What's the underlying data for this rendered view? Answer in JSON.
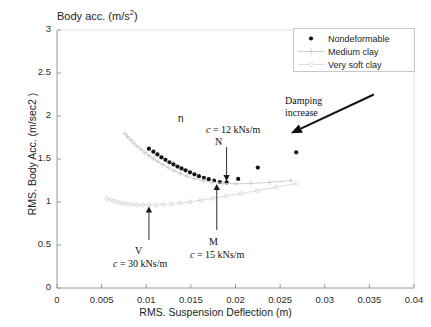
{
  "figure": {
    "title": "Body acc. (m/s2)",
    "title_base": "Body acc. (m/s",
    "title_sup": "2",
    "title_close": ")",
    "caption": ""
  },
  "axes": {
    "xlabel": "RMS. Suspension Deflection (m)",
    "ylabel": "RMS. Body Acc. (m/sec2 )",
    "xticks": [
      "0",
      "0.005",
      "0.01",
      "0.015",
      "0.02",
      "0.025",
      "0.03",
      "0.035",
      "0.04"
    ],
    "yticks": [
      "0",
      "0.5",
      "1",
      "1.5",
      "2",
      "2.5",
      "3"
    ]
  },
  "legend": {
    "items": [
      {
        "label": "Nondeformable",
        "marker": "dot",
        "color": "#111111"
      },
      {
        "label": "Medium clay",
        "marker": "plus",
        "color": "#c9c9c9"
      },
      {
        "label": "Very soft clay",
        "marker": "circle-line",
        "color": "#d8d8d8"
      }
    ]
  },
  "annotations": {
    "n_label": "n",
    "c12": "c = 12 kNs/m",
    "c12_sym": "c",
    "c12_rest": " = 12 kNs/m",
    "N_label": "N",
    "V_label": "V",
    "c30_sym": "c",
    "c30_rest": " = 30 kNs/m",
    "M_label": "M",
    "c15_sym": "c",
    "c15_rest": " = 15 kNs/m",
    "damping_line1": "Damping",
    "damping_line2": "increase"
  },
  "chart_data": {
    "type": "scatter",
    "title": "Body acc. (m/s2)",
    "xlabel": "RMS. Suspension Deflection (m)",
    "ylabel": "RMS. Body Acc. (m/sec2 )",
    "xlim": [
      0,
      0.04
    ],
    "ylim": [
      0,
      3
    ],
    "xtick_step": 0.005,
    "ytick_step": 0.5,
    "grid": false,
    "legend_position": "top-right",
    "series": [
      {
        "name": "Nondeformable",
        "marker": "dot",
        "color": "#111111",
        "points": [
          [
            0.0103,
            1.62
          ],
          [
            0.0108,
            1.585
          ],
          [
            0.01125,
            1.553
          ],
          [
            0.0117,
            1.52
          ],
          [
            0.01215,
            1.49
          ],
          [
            0.0126,
            1.462
          ],
          [
            0.01305,
            1.437
          ],
          [
            0.0135,
            1.412
          ],
          [
            0.01395,
            1.39
          ],
          [
            0.0144,
            1.368
          ],
          [
            0.0149,
            1.345
          ],
          [
            0.0154,
            1.322
          ],
          [
            0.0159,
            1.3
          ],
          [
            0.01645,
            1.282
          ],
          [
            0.017,
            1.265
          ],
          [
            0.0176,
            1.248
          ],
          [
            0.01825,
            1.232
          ],
          [
            0.019,
            1.228
          ],
          [
            0.0203,
            1.268
          ],
          [
            0.0225,
            1.4
          ],
          [
            0.0268,
            1.578
          ]
        ]
      },
      {
        "name": "Medium clay",
        "marker": "plus",
        "color": "#c9c9c9",
        "points": [
          [
            0.0076,
            1.795
          ],
          [
            0.0079,
            1.76
          ],
          [
            0.00825,
            1.722
          ],
          [
            0.0086,
            1.685
          ],
          [
            0.009,
            1.648
          ],
          [
            0.0094,
            1.612
          ],
          [
            0.00985,
            1.575
          ],
          [
            0.0103,
            1.54
          ],
          [
            0.0108,
            1.505
          ],
          [
            0.0113,
            1.47
          ],
          [
            0.01185,
            1.435
          ],
          [
            0.01245,
            1.4
          ],
          [
            0.0131,
            1.365
          ],
          [
            0.0138,
            1.332
          ],
          [
            0.01455,
            1.3
          ],
          [
            0.0154,
            1.272
          ],
          [
            0.01635,
            1.248
          ],
          [
            0.0174,
            1.23
          ],
          [
            0.0186,
            1.218
          ],
          [
            0.02,
            1.212
          ],
          [
            0.0217,
            1.215
          ],
          [
            0.0238,
            1.228
          ],
          [
            0.0262,
            1.248
          ]
        ]
      },
      {
        "name": "Very soft clay",
        "marker": "circle-line",
        "color": "#d8d8d8",
        "points": [
          [
            0.0056,
            1.04
          ],
          [
            0.006,
            1.022
          ],
          [
            0.0064,
            1.008
          ],
          [
            0.00685,
            0.996
          ],
          [
            0.0073,
            0.986
          ],
          [
            0.0078,
            0.978
          ],
          [
            0.00835,
            0.972
          ],
          [
            0.00895,
            0.968
          ],
          [
            0.0096,
            0.965
          ],
          [
            0.0103,
            0.964
          ],
          [
            0.01105,
            0.966
          ],
          [
            0.0119,
            0.97
          ],
          [
            0.0128,
            0.978
          ],
          [
            0.0138,
            0.988
          ],
          [
            0.0149,
            1.002
          ],
          [
            0.0161,
            1.02
          ],
          [
            0.01745,
            1.042
          ],
          [
            0.01895,
            1.068
          ],
          [
            0.0206,
            1.098
          ],
          [
            0.02245,
            1.132
          ],
          [
            0.0245,
            1.172
          ],
          [
            0.0268,
            1.215
          ]
        ]
      }
    ],
    "markers": [
      {
        "label": "N",
        "note": "c = 12 kNs/m",
        "x": 0.019,
        "y": 1.228,
        "series": "Nondeformable"
      },
      {
        "label": "M",
        "note": "c = 15 kNs/m",
        "x": 0.0179,
        "y": 1.228,
        "series": "Medium clay"
      },
      {
        "label": "V",
        "note": "c = 30 kNs/m",
        "x": 0.0103,
        "y": 0.964,
        "series": "Very soft clay"
      }
    ],
    "arrow_annotation": {
      "text": "Damping increase",
      "from": [
        0.0355,
        2.25
      ],
      "to": [
        0.0262,
        1.8
      ]
    }
  }
}
